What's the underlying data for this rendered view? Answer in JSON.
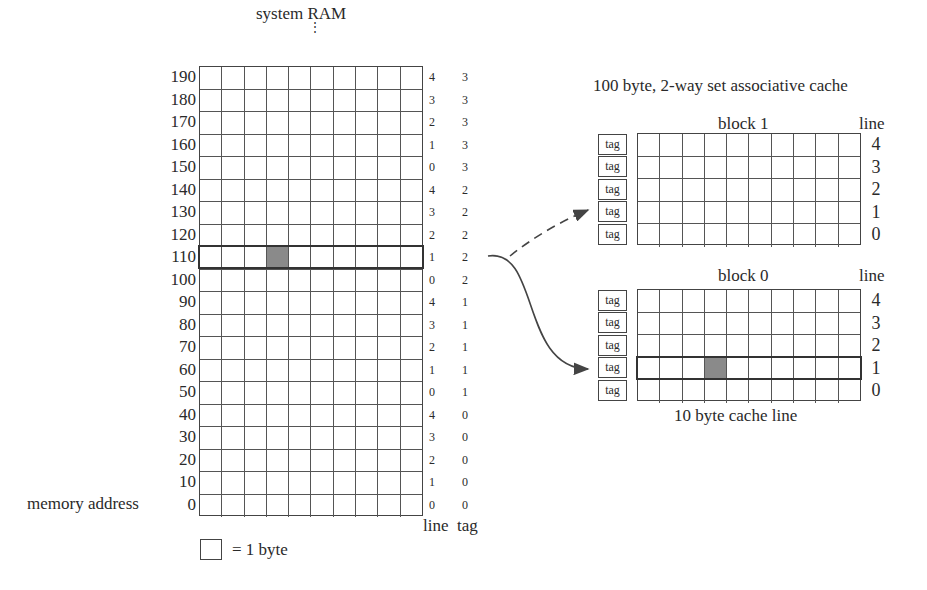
{
  "ram": {
    "title": "system RAM",
    "ellipsis": "⋮",
    "address_axis_label": "memory address",
    "rows": [
      {
        "address": "190",
        "line": "4",
        "tag": "3"
      },
      {
        "address": "180",
        "line": "3",
        "tag": "3"
      },
      {
        "address": "170",
        "line": "2",
        "tag": "3"
      },
      {
        "address": "160",
        "line": "1",
        "tag": "3"
      },
      {
        "address": "150",
        "line": "0",
        "tag": "3"
      },
      {
        "address": "140",
        "line": "4",
        "tag": "2"
      },
      {
        "address": "130",
        "line": "3",
        "tag": "2"
      },
      {
        "address": "120",
        "line": "2",
        "tag": "2"
      },
      {
        "address": "110",
        "line": "1",
        "tag": "2"
      },
      {
        "address": "100",
        "line": "0",
        "tag": "2"
      },
      {
        "address": "90",
        "line": "4",
        "tag": "1"
      },
      {
        "address": "80",
        "line": "3",
        "tag": "1"
      },
      {
        "address": "70",
        "line": "2",
        "tag": "1"
      },
      {
        "address": "60",
        "line": "1",
        "tag": "1"
      },
      {
        "address": "50",
        "line": "0",
        "tag": "1"
      },
      {
        "address": "40",
        "line": "4",
        "tag": "0"
      },
      {
        "address": "30",
        "line": "3",
        "tag": "0"
      },
      {
        "address": "20",
        "line": "2",
        "tag": "0"
      },
      {
        "address": "10",
        "line": "1",
        "tag": "0"
      },
      {
        "address": "0",
        "line": "0",
        "tag": "0"
      }
    ],
    "bytes_per_row": 10,
    "highlighted_row_address": "110",
    "highlighted_byte_index": 3,
    "column_labels": {
      "line": "line",
      "tag": "tag"
    },
    "legend": "= 1 byte"
  },
  "cache": {
    "title": "100 byte, 2-way set associative cache",
    "line_header": "line",
    "tag_label": "tag",
    "caption": "10 byte cache line",
    "blocks": [
      {
        "name": "block 1",
        "lines": [
          "4",
          "3",
          "2",
          "1",
          "0"
        ]
      },
      {
        "name": "block 0",
        "lines": [
          "4",
          "3",
          "2",
          "1",
          "0"
        ],
        "highlighted_line": "1",
        "highlighted_byte_index": 3
      }
    ]
  },
  "arrows": [
    {
      "from": "ram row 110",
      "to": "block 1 line 1",
      "style": "dashed"
    },
    {
      "from": "ram row 110",
      "to": "block 0 line 1",
      "style": "solid"
    }
  ],
  "colors": {
    "ink": "#2a2a2a",
    "grid": "#555555",
    "filled_byte": "#8a8a8a",
    "background": "#ffffff"
  }
}
